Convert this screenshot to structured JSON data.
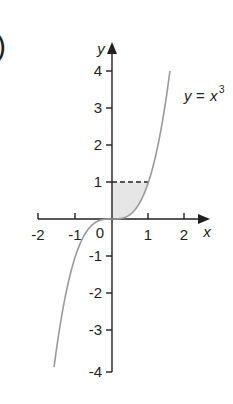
{
  "figure": {
    "part_label": ")",
    "curve_label_lhs": "y",
    "curve_label_eq": "=",
    "curve_label_rhs": "x",
    "curve_label_exp": "3"
  },
  "chart_data": {
    "type": "line",
    "title": "",
    "function": "y = x^3",
    "xlabel": "x",
    "ylabel": "y",
    "xlim": [
      -2,
      2.3
    ],
    "ylim": [
      -4,
      4.5
    ],
    "x_ticks": [
      -2,
      -1,
      1,
      2
    ],
    "x_tick_labels": [
      "-2",
      "-1",
      "1",
      "2"
    ],
    "y_ticks": [
      -4,
      -3,
      -2,
      -1,
      1,
      2,
      3,
      4
    ],
    "y_tick_labels": [
      "-4",
      "-3",
      "-2",
      "-1",
      "1",
      "2",
      "3",
      "4"
    ],
    "origin_label": "0",
    "series": [
      {
        "name": "y = x^3",
        "x": [
          -1.587,
          -1.5,
          -1.25,
          -1.0,
          -0.75,
          -0.5,
          -0.25,
          0,
          0.25,
          0.5,
          0.75,
          1.0,
          1.25,
          1.5,
          1.587
        ],
        "y": [
          -4.0,
          -3.375,
          -1.953,
          -1.0,
          -0.422,
          -0.125,
          -0.016,
          0,
          0.016,
          0.125,
          0.422,
          1.0,
          1.953,
          3.375,
          4.0
        ],
        "color": "#9a9a9a"
      }
    ],
    "annotations": [
      {
        "type": "dashed_line",
        "from": [
          0,
          1
        ],
        "to": [
          1,
          1
        ],
        "label": "y = 1"
      },
      {
        "type": "shaded_region",
        "description": "region between y-axis, y = 1 and curve y = x^3 for 0 <= y <= 1",
        "color": "#e6e6e6"
      }
    ],
    "grid": false,
    "legend": "none"
  },
  "colors": {
    "axis": "#231f20",
    "curve": "#9a9a9a",
    "shade": "#e6e6e6",
    "text": "#231f20"
  }
}
